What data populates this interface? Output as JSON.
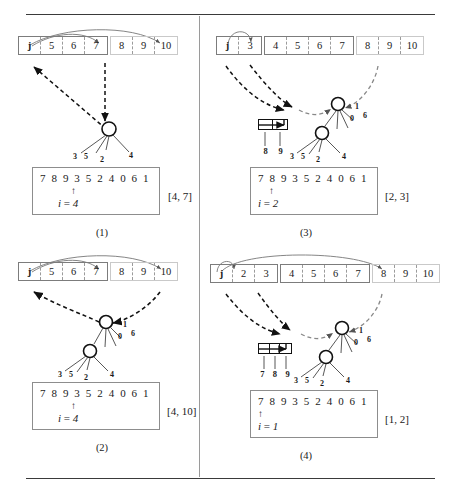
{
  "figure": {
    "sequence": "7 8 9 3 5 2 4 0 6 1",
    "pointer_glyph": "↑",
    "i_prefix": "i",
    "equals": " = "
  },
  "panels": [
    {
      "id": "p1",
      "caption": "(1)",
      "array": {
        "groups": [
          {
            "style": "solid",
            "cells": [
              "j",
              "5",
              "6",
              "7"
            ]
          },
          {
            "style": "ghost",
            "cells": [
              "8",
              "9",
              "10"
            ]
          }
        ]
      },
      "buffer": null,
      "tree": {
        "nodes": [
          "hub"
        ],
        "hub_labels": [
          "3",
          "5",
          "2",
          "4"
        ],
        "child_labels": []
      },
      "seq": "7 8 9 3 5 2 4 0 6 1",
      "i_value": "4",
      "pointer_index": 4,
      "range": "[4, 7]"
    },
    {
      "id": "p3",
      "caption": "(3)",
      "array": {
        "groups": [
          {
            "style": "solid",
            "cells": [
              "j",
              "3"
            ]
          },
          {
            "style": "solid",
            "cells": [
              "4",
              "5",
              "6",
              "7"
            ]
          },
          {
            "style": "ghost",
            "cells": [
              "8",
              "9",
              "10"
            ]
          }
        ]
      },
      "buffer": {
        "labels": [
          "8",
          "9"
        ],
        "slots": 2
      },
      "tree": {
        "nodes": [
          "hub",
          "child"
        ],
        "hub_labels": [
          "0",
          "6",
          "1"
        ],
        "child_labels": [
          "3",
          "5",
          "2",
          "4"
        ]
      },
      "seq": "7 8 9 3 5 2 4 0 6 1",
      "i_value": "2",
      "pointer_index": 2,
      "range": "[2, 3]"
    },
    {
      "id": "p2",
      "caption": "(2)",
      "array": {
        "groups": [
          {
            "style": "solid",
            "cells": [
              "j",
              "5",
              "6",
              "7"
            ]
          },
          {
            "style": "ghost",
            "cells": [
              "8",
              "9",
              "10"
            ]
          }
        ]
      },
      "buffer": null,
      "tree": {
        "nodes": [
          "hub",
          "child"
        ],
        "hub_labels": [
          "0",
          "6",
          "1"
        ],
        "child_labels": [
          "3",
          "5",
          "2",
          "4"
        ]
      },
      "seq": "7 8 9 3 5 2 4 0 6 1",
      "i_value": "4",
      "pointer_index": 4,
      "range": "[4, 10]"
    },
    {
      "id": "p4",
      "caption": "(4)",
      "array": {
        "groups": [
          {
            "style": "solid",
            "cells": [
              "j",
              "2",
              "3"
            ]
          },
          {
            "style": "solid",
            "cells": [
              "4",
              "5",
              "6",
              "7"
            ]
          },
          {
            "style": "ghost",
            "cells": [
              "8",
              "9",
              "10"
            ]
          }
        ]
      },
      "buffer": {
        "labels": [
          "7",
          "8",
          "9"
        ],
        "slots": 3
      },
      "tree": {
        "nodes": [
          "hub",
          "child"
        ],
        "hub_labels": [
          "0",
          "6",
          "1"
        ],
        "child_labels": [
          "3",
          "5",
          "2",
          "4"
        ]
      },
      "seq": "7 8 9 3 5 2 4 0 6 1",
      "i_value": "1",
      "pointer_index": 1,
      "range": "[1, 2]"
    }
  ]
}
